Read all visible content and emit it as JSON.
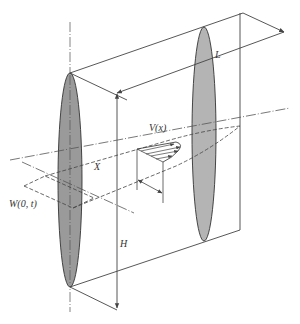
{
  "figure": {
    "colors": {
      "line": "#444444",
      "ellipse_fill": "#9a9a9a",
      "ellipse_fill_light": "#b4b4b4",
      "background": "#ffffff"
    },
    "labels": {
      "length": "L",
      "velocity": "V(x)",
      "distance": "X",
      "source": "W(0, t)",
      "height": "H"
    }
  }
}
